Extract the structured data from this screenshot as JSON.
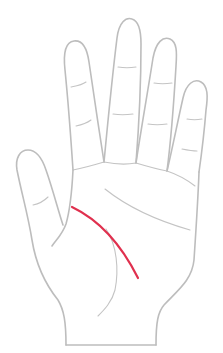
{
  "diagram": {
    "subject": "Palm of hand",
    "highlighted_line": "Life line",
    "colors": {
      "background": "#ffffff",
      "outline": "#bdbdbd",
      "crease": "#c4c4c4",
      "highlight": "#e0304e"
    },
    "parts": [
      {
        "id": "thumb",
        "label": "Thumb"
      },
      {
        "id": "index-finger",
        "label": "Index finger"
      },
      {
        "id": "middle-finger",
        "label": "Middle finger"
      },
      {
        "id": "ring-finger",
        "label": "Ring finger"
      },
      {
        "id": "little-finger",
        "label": "Little finger"
      },
      {
        "id": "palm",
        "label": "Palm"
      },
      {
        "id": "wrist",
        "label": "Wrist"
      }
    ],
    "lines": [
      {
        "id": "life-line",
        "label": "Life line",
        "highlighted": true
      },
      {
        "id": "head-line",
        "label": "Head line",
        "highlighted": false
      },
      {
        "id": "heart-line",
        "label": "Heart line",
        "highlighted": false
      }
    ]
  }
}
